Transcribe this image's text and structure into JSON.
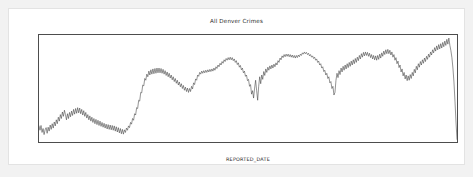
{
  "chart_data": {
    "type": "line",
    "title": "All Denver Crimes",
    "xlabel": "REPORTED_DATE",
    "ylabel": "",
    "grid": false,
    "legend": null,
    "ylim": [
      850,
      2080
    ],
    "xlim": [
      "2012-06-01",
      "2017-11-15"
    ],
    "yticks": [
      1000,
      1200,
      1400,
      1600,
      1800,
      2000
    ],
    "ytick_labels": [
      "1000",
      "1200",
      "1400",
      "1600",
      "1800",
      "2000"
    ],
    "xticks": [
      "2013",
      "2014",
      "2015",
      "2016",
      "2017"
    ],
    "xtick_labels": [
      "2013",
      "2014",
      "2015",
      "2016",
      "2017"
    ],
    "line_color": "#3b3b3b",
    "series": [
      {
        "name": "All Denver Crimes",
        "x_start": "2012-06-01",
        "x_step_days": 7,
        "values": [
          1035,
          985,
          1040,
          960,
          1005,
          935,
          990,
          1015,
          950,
          1020,
          975,
          1045,
          995,
          1060,
          1010,
          1080,
          1035,
          1105,
          1060,
          1135,
          1090,
          1165,
          1120,
          1195,
          1145,
          1215,
          1165,
          1105,
          1175,
          1120,
          1190,
          1140,
          1205,
          1155,
          1225,
          1170,
          1235,
          1180,
          1245,
          1185,
          1240,
          1175,
          1225,
          1160,
          1210,
          1145,
          1190,
          1125,
          1165,
          1105,
          1150,
          1090,
          1135,
          1075,
          1120,
          1060,
          1110,
          1050,
          1100,
          1040,
          1090,
          1030,
          1075,
          1020,
          1065,
          1010,
          1055,
          1000,
          1050,
          995,
          1045,
          990,
          1040,
          985,
          1035,
          975,
          1025,
          965,
          1015,
          955,
          1005,
          945,
          995,
          940,
          990,
          960,
          1010,
          985,
          1035,
          1015,
          1075,
          1055,
          1120,
          1100,
          1175,
          1160,
          1245,
          1235,
          1330,
          1320,
          1420,
          1415,
          1505,
          1495,
          1580,
          1560,
          1630,
          1600,
          1665,
          1620,
          1680,
          1630,
          1690,
          1635,
          1695,
          1640,
          1700,
          1645,
          1700,
          1645,
          1695,
          1640,
          1685,
          1630,
          1670,
          1615,
          1655,
          1600,
          1640,
          1585,
          1620,
          1565,
          1600,
          1545,
          1580,
          1525,
          1560,
          1505,
          1540,
          1485,
          1520,
          1465,
          1500,
          1445,
          1480,
          1430,
          1470,
          1420,
          1465,
          1430,
          1490,
          1460,
          1530,
          1510,
          1575,
          1560,
          1620,
          1605,
          1650,
          1630,
          1665,
          1640,
          1670,
          1645,
          1675,
          1650,
          1680,
          1655,
          1685,
          1660,
          1690,
          1665,
          1700,
          1675,
          1715,
          1695,
          1735,
          1715,
          1755,
          1735,
          1775,
          1755,
          1795,
          1775,
          1810,
          1790,
          1820,
          1795,
          1825,
          1795,
          1820,
          1785,
          1805,
          1765,
          1785,
          1740,
          1760,
          1710,
          1730,
          1680,
          1700,
          1645,
          1665,
          1605,
          1620,
          1555,
          1570,
          1490,
          1510,
          1400,
          1440,
          1355,
          1470,
          1560,
          1440,
          1330,
          1490,
          1600,
          1520,
          1620,
          1570,
          1660,
          1615,
          1690,
          1650,
          1710,
          1675,
          1725,
          1690,
          1735,
          1700,
          1745,
          1715,
          1760,
          1735,
          1785,
          1765,
          1815,
          1795,
          1840,
          1820,
          1855,
          1830,
          1860,
          1835,
          1860,
          1830,
          1855,
          1825,
          1850,
          1820,
          1845,
          1815,
          1845,
          1820,
          1850,
          1830,
          1860,
          1845,
          1875,
          1860,
          1885,
          1865,
          1880,
          1855,
          1870,
          1840,
          1855,
          1825,
          1840,
          1810,
          1825,
          1790,
          1805,
          1765,
          1780,
          1735,
          1750,
          1700,
          1715,
          1660,
          1675,
          1620,
          1640,
          1580,
          1600,
          1530,
          1545,
          1465,
          1490,
          1390,
          1420,
          1560,
          1640,
          1590,
          1670,
          1625,
          1700,
          1655,
          1720,
          1675,
          1735,
          1690,
          1750,
          1705,
          1765,
          1720,
          1780,
          1735,
          1795,
          1750,
          1810,
          1765,
          1825,
          1785,
          1845,
          1805,
          1865,
          1825,
          1880,
          1840,
          1885,
          1845,
          1880,
          1835,
          1870,
          1820,
          1855,
          1805,
          1845,
          1795,
          1840,
          1790,
          1845,
          1800,
          1860,
          1815,
          1875,
          1835,
          1895,
          1855,
          1910,
          1865,
          1915,
          1865,
          1905,
          1850,
          1885,
          1825,
          1855,
          1790,
          1820,
          1750,
          1780,
          1705,
          1735,
          1655,
          1690,
          1610,
          1650,
          1575,
          1620,
          1555,
          1610,
          1560,
          1625,
          1580,
          1650,
          1610,
          1685,
          1645,
          1720,
          1680,
          1750,
          1710,
          1775,
          1735,
          1795,
          1755,
          1815,
          1775,
          1835,
          1800,
          1860,
          1825,
          1885,
          1850,
          1910,
          1875,
          1935,
          1895,
          1955,
          1910,
          1970,
          1920,
          1980,
          1930,
          1995,
          1945,
          2010,
          1960,
          2030,
          1975,
          2045,
          1960,
          1900,
          1820,
          1700,
          1540,
          1320,
          1080,
          880
        ]
      }
    ],
    "annotations": []
  },
  "figure": {
    "background": "#ffffff",
    "page_background": "#f2f2f2",
    "border_color": "#e3e3e3",
    "axis_color": "#4d4d4d"
  }
}
